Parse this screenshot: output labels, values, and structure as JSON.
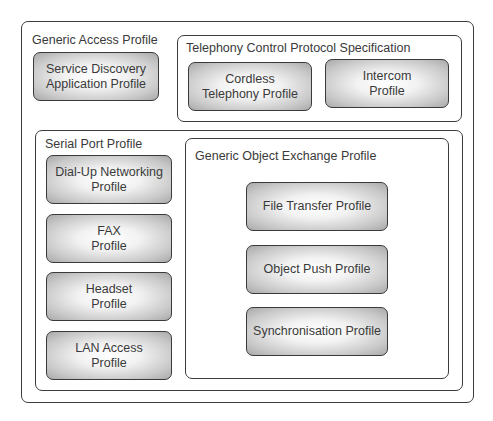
{
  "diagram": {
    "type": "bluetooth-profile-hierarchy",
    "generic_access_profile": {
      "label": "Generic Access Profile",
      "profiles": [
        {
          "label": "Service Discovery\nApplication Profile"
        }
      ],
      "telephony_control": {
        "label": "Telephony Control Protocol Specification",
        "profiles": [
          {
            "label": "Cordless\nTelephony Profile"
          },
          {
            "label": "Intercom\nProfile"
          }
        ]
      },
      "serial_port_profile": {
        "label": "Serial Port Profile",
        "profiles": [
          {
            "label": "Dial-Up Networking\nProfile"
          },
          {
            "label": "FAX\nProfile"
          },
          {
            "label": "Headset\nProfile"
          },
          {
            "label": "LAN Access\nProfile"
          }
        ],
        "generic_object_exchange": {
          "label": "Generic Object Exchange Profile",
          "profiles": [
            {
              "label": "File Transfer Profile"
            },
            {
              "label": "Object Push Profile"
            },
            {
              "label": "Synchronisation Profile"
            }
          ]
        }
      }
    },
    "colors": {
      "border": "#3c3c3c",
      "text": "#3a3a3a",
      "box_center": "#ffffff",
      "box_edge": "#a9a9a9"
    }
  }
}
